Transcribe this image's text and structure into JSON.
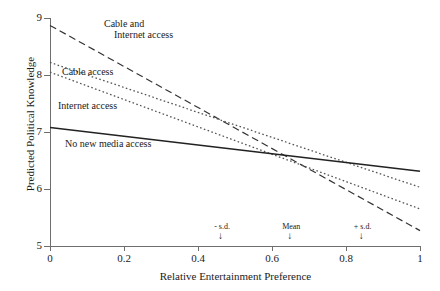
{
  "chart_data": {
    "type": "line",
    "title": "",
    "xlabel": "Relative Entertainment Preference",
    "ylabel": "Predicted Political Knowledge",
    "xlim": [
      0,
      1
    ],
    "ylim": [
      5,
      9
    ],
    "xticks": [
      "0",
      "0.2",
      "0.4",
      "0.6",
      "0.8",
      "1"
    ],
    "xtick_values": [
      0,
      0.2,
      0.4,
      0.6,
      0.8,
      1
    ],
    "yticks": [
      "5",
      "6",
      "7",
      "8",
      "9"
    ],
    "ytick_values": [
      5,
      6,
      7,
      8,
      9
    ],
    "grid": false,
    "legend": "inline-labels",
    "series": [
      {
        "name": "Cable and Internet access",
        "style": "long-dash",
        "color": "#333333",
        "x": [
          0,
          1
        ],
        "values": [
          8.87,
          5.27
        ]
      },
      {
        "name": "Cable access",
        "style": "dotted",
        "color": "#555555",
        "x": [
          0,
          1
        ],
        "values": [
          8.22,
          6.03
        ]
      },
      {
        "name": "Internet access",
        "style": "dotted",
        "color": "#555555",
        "x": [
          0,
          1
        ],
        "values": [
          8.05,
          5.65
        ]
      },
      {
        "name": "No new media access",
        "style": "solid",
        "color": "#222222",
        "x": [
          0,
          1
        ],
        "values": [
          7.08,
          6.31
        ]
      }
    ],
    "annotations": [
      {
        "label": "- s.d.",
        "x": 0.465,
        "arrow": "down"
      },
      {
        "label": "Mean",
        "x": 0.652,
        "arrow": "down"
      },
      {
        "label": "+ s.d.",
        "x": 0.845,
        "arrow": "down"
      }
    ]
  },
  "series_labels": {
    "cable_internet_line1": "Cable and",
    "cable_internet_line2": "Internet access",
    "cable": "Cable access",
    "internet": "Internet access",
    "nomedia": "No new media access"
  }
}
